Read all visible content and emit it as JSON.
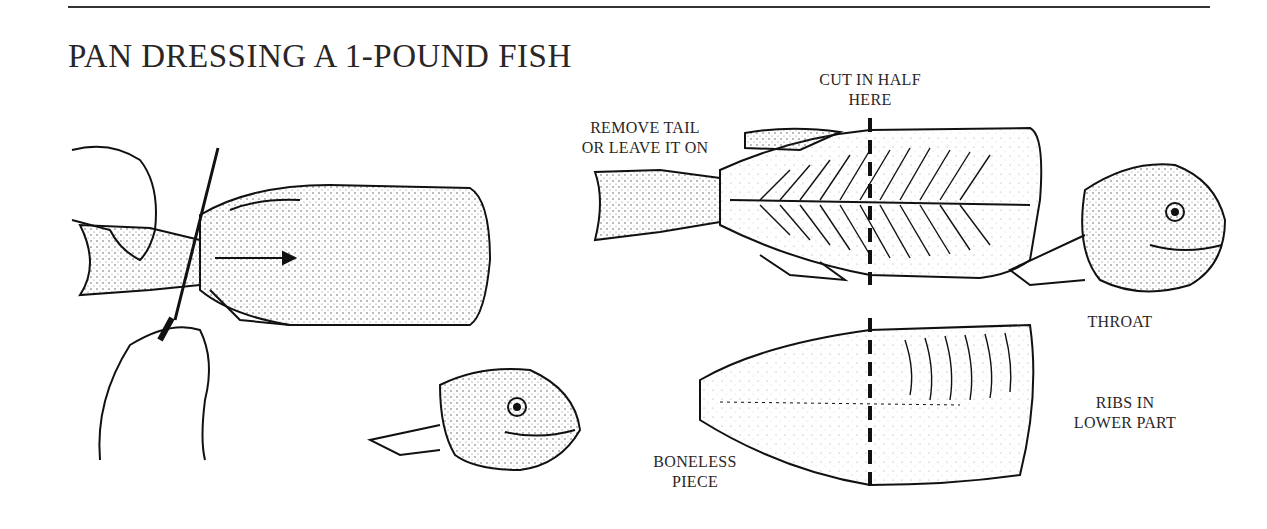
{
  "title": "PAN DRESSING A 1-POUND FISH",
  "labels": {
    "cut_in_half": [
      "CUT IN HALF",
      "HERE"
    ],
    "remove_tail": [
      "REMOVE TAIL",
      "OR LEAVE IT ON"
    ],
    "throat": "THROAT",
    "ribs": [
      "RIBS IN",
      "LOWER PART"
    ],
    "boneless": [
      "BONELESS",
      "PIECE"
    ]
  },
  "colors": {
    "ink": "#231f20",
    "paper": "#ffffff"
  }
}
